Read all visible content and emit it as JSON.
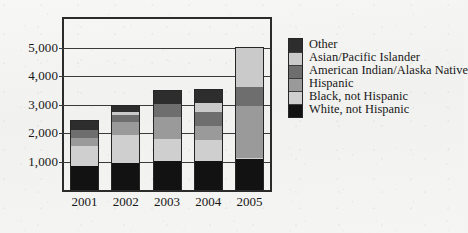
{
  "chart_data": {
    "type": "bar",
    "subtype": "stacked-bar",
    "title": "",
    "xlabel": "",
    "ylabel": "",
    "categories": [
      "2001",
      "2002",
      "2003",
      "2004",
      "2005"
    ],
    "ylim": [
      0,
      6000
    ],
    "yticks": [
      1000,
      2000,
      3000,
      4000,
      5000
    ],
    "ytick_labels": [
      "1,000",
      "2,000",
      "3,000",
      "4,000",
      "5,000"
    ],
    "grid": true,
    "legend_position": "right",
    "series": [
      {
        "name": "White, not Hispanic",
        "color": "#121212",
        "values": [
          830,
          960,
          1010,
          1030,
          1080
        ]
      },
      {
        "name": "Black, not Hispanic",
        "color": "#cfcfcf",
        "values": [
          730,
          960,
          790,
          720,
          40
        ]
      },
      {
        "name": "Hispanic",
        "color": "#9a9a9a",
        "values": [
          280,
          480,
          760,
          480,
          1830
        ]
      },
      {
        "name": "American Indian/Alaska Native",
        "color": "#6e6e6e",
        "values": [
          280,
          240,
          450,
          520,
          660
        ]
      },
      {
        "name": "Asian/Pacific Islander",
        "color": "#cacaca",
        "values": [
          0,
          90,
          0,
          310,
          1380
        ]
      },
      {
        "name": "Other",
        "color": "#2d2d2d",
        "values": [
          350,
          270,
          490,
          490,
          10
        ]
      }
    ],
    "totals": [
      2470,
      3000,
      3500,
      3550,
      5000
    ]
  },
  "legend": {
    "entries": [
      {
        "label": "Other",
        "color": "#2d2d2d"
      },
      {
        "label": "Asian/Pacific Islander",
        "color": "#cacaca"
      },
      {
        "label": "American Indian/Alaska Native",
        "color": "#6e6e6e"
      },
      {
        "label": "Hispanic",
        "color": "#9a9a9a"
      },
      {
        "label": "Black, not Hispanic",
        "color": "#cfcfcf"
      },
      {
        "label": "White, not Hispanic",
        "color": "#121212"
      }
    ]
  },
  "colors": {
    "axis": "#2b2b2b",
    "grid": "#3a3a3a",
    "background": "#f4f4f2",
    "text": "#171717"
  }
}
